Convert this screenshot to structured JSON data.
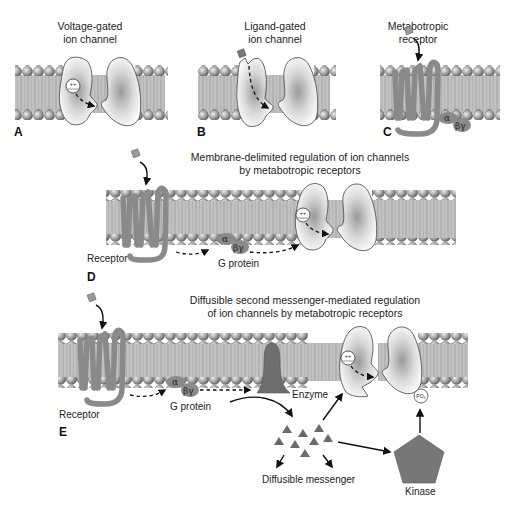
{
  "panels": {
    "A": {
      "letter": "A",
      "title_line1": "Voltage-gated",
      "title_line2": "ion channel",
      "channel_charge": "++"
    },
    "B": {
      "letter": "B",
      "title_line1": "Ligand-gated",
      "title_line2": "ion channel"
    },
    "C": {
      "letter": "C",
      "title_line1": "Metabotropic",
      "title_line2": "receptor",
      "alpha": "α",
      "betagamma": "βγ"
    },
    "D": {
      "letter": "D",
      "title_line1": "Membrane-delimited regulation of ion channels",
      "title_line2": "by metabotropic receptors",
      "receptor_label": "Receptor",
      "gprotein_label": "G protein",
      "alpha": "α",
      "betagamma": "βγ",
      "channel_charge": "++"
    },
    "E": {
      "letter": "E",
      "title_line1": "Diffusible second messenger-mediated regulation",
      "title_line2": "of ion channels by metabotropic receptors",
      "receptor_label": "Receptor",
      "gprotein_label": "G protein",
      "enzyme_label": "Enzyme",
      "messenger_label": "Diffusible messenger",
      "kinase_label": "Kinase",
      "phosphate_label": "PO₄",
      "alpha": "α",
      "betagamma": "βγ",
      "channel_charge": "++"
    }
  },
  "colors": {
    "membrane": "#a9a9a9",
    "lipid_head": "#9a9a9a",
    "receptor": "#8a8a8a",
    "enzyme": "#6e6e6e",
    "kinase": "#777777",
    "messenger": "#6a6a6a"
  }
}
